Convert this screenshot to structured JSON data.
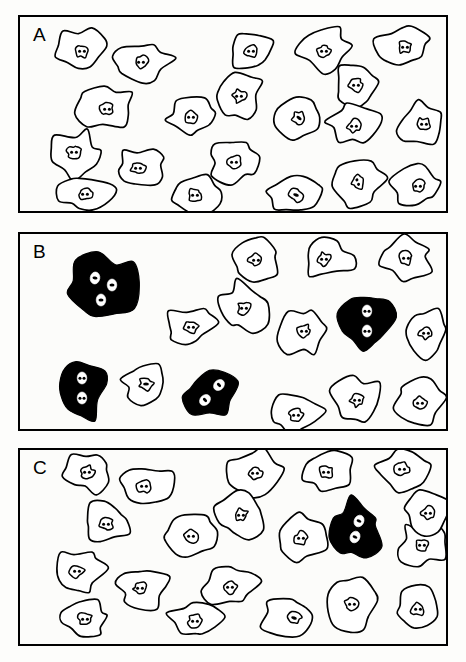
{
  "figure": {
    "type": "scientific-line-drawing",
    "panel_count": 3,
    "background_color": "#fdfdfb",
    "outline_color": "#000000",
    "filled_cell_color": "#000000",
    "unfilled_cell_color": "#ffffff"
  },
  "panels": [
    {
      "id": "A",
      "label": "A",
      "x": 18,
      "y": 15,
      "w": 430,
      "h": 198,
      "total_cells": 20,
      "mononuclear_cells": 20,
      "multinucleated_filled_cells": 0
    },
    {
      "id": "B",
      "label": "B",
      "x": 18,
      "y": 232,
      "w": 430,
      "h": 199,
      "total_cells": 16,
      "mononuclear_cells": 12,
      "multinucleated_filled_cells": 4
    },
    {
      "id": "C",
      "label": "C",
      "x": 18,
      "y": 448,
      "w": 430,
      "h": 198,
      "total_cells": 20,
      "mononuclear_cells": 19,
      "multinucleated_filled_cells": 1
    }
  ],
  "chart_data": {
    "type": "diagram",
    "title": "",
    "panels": [
      "A",
      "B",
      "C"
    ],
    "series": [
      {
        "name": "Mononuclear cells",
        "values": [
          20,
          12,
          19
        ]
      },
      {
        "name": "Multinucleated giant cells (filled black)",
        "values": [
          0,
          4,
          1
        ]
      }
    ],
    "nuclei_per_filled_cell": {
      "A": [],
      "B": [
        3,
        2,
        2,
        2
      ],
      "C": [
        2
      ]
    }
  },
  "cells": {
    "A": [
      {
        "cx": 80,
        "cy": 47,
        "rx": 27,
        "ry": 21,
        "seed": 11,
        "filled": false,
        "nuclei": [
          {
            "dx": 0,
            "dy": 2,
            "r": 7,
            "dots": 2,
            "rot": 0
          }
        ]
      },
      {
        "cx": 141,
        "cy": 59,
        "rx": 29,
        "ry": 19,
        "seed": 22,
        "filled": false,
        "nuclei": [
          {
            "dx": -2,
            "dy": 1,
            "r": 7,
            "dots": 2,
            "rot": 0
          }
        ]
      },
      {
        "cx": 249,
        "cy": 48,
        "rx": 24,
        "ry": 20,
        "seed": 33,
        "filled": false,
        "nuclei": [
          {
            "dx": 0,
            "dy": 1,
            "r": 7,
            "dots": 2,
            "rot": 0
          }
        ]
      },
      {
        "cx": 322,
        "cy": 47,
        "rx": 26,
        "ry": 22,
        "seed": 44,
        "filled": false,
        "nuclei": [
          {
            "dx": 0,
            "dy": 2,
            "r": 7,
            "dots": 2,
            "rot": 0
          }
        ]
      },
      {
        "cx": 401,
        "cy": 45,
        "rx": 27,
        "ry": 21,
        "seed": 55,
        "filled": false,
        "nuclei": [
          {
            "dx": 2,
            "dy": 0,
            "r": 7,
            "dots": 2,
            "rot": 0
          }
        ]
      },
      {
        "cx": 354,
        "cy": 83,
        "rx": 22,
        "ry": 21,
        "seed": 66,
        "filled": false,
        "nuclei": [
          {
            "dx": 0,
            "dy": 0,
            "r": 7,
            "dots": 2,
            "rot": 0
          }
        ]
      },
      {
        "cx": 105,
        "cy": 105,
        "rx": 28,
        "ry": 21,
        "seed": 77,
        "filled": false,
        "nuclei": [
          {
            "dx": 0,
            "dy": 2,
            "r": 7,
            "dots": 2,
            "rot": 0
          }
        ]
      },
      {
        "cx": 189,
        "cy": 114,
        "rx": 25,
        "ry": 18,
        "seed": 88,
        "filled": false,
        "nuclei": [
          {
            "dx": 0,
            "dy": 1,
            "r": 7,
            "dots": 2,
            "rot": 0
          }
        ]
      },
      {
        "cx": 237,
        "cy": 95,
        "rx": 24,
        "ry": 23,
        "seed": 99,
        "filled": false,
        "nuclei": [
          {
            "dx": 0,
            "dy": -1,
            "r": 7,
            "dots": 2,
            "rot": 0
          }
        ]
      },
      {
        "cx": 296,
        "cy": 118,
        "rx": 26,
        "ry": 21,
        "seed": 101,
        "filled": false,
        "nuclei": [
          {
            "dx": 1,
            "dy": -2,
            "r": 7,
            "dots": 1,
            "rot": 35
          }
        ]
      },
      {
        "cx": 352,
        "cy": 123,
        "rx": 26,
        "ry": 20,
        "seed": 112,
        "filled": false,
        "nuclei": [
          {
            "dx": 0,
            "dy": 1,
            "r": 7,
            "dots": 2,
            "rot": 0
          }
        ]
      },
      {
        "cx": 420,
        "cy": 121,
        "rx": 24,
        "ry": 20,
        "seed": 123,
        "filled": false,
        "nuclei": [
          {
            "dx": 2,
            "dy": 1,
            "r": 7,
            "dots": 2,
            "rot": 0
          }
        ]
      },
      {
        "cx": 74,
        "cy": 152,
        "rx": 25,
        "ry": 23,
        "seed": 134,
        "filled": false,
        "nuclei": [
          {
            "dx": -2,
            "dy": -2,
            "r": 7,
            "dots": 2,
            "rot": 0
          }
        ]
      },
      {
        "cx": 139,
        "cy": 165,
        "rx": 27,
        "ry": 19,
        "seed": 145,
        "filled": false,
        "nuclei": [
          {
            "dx": -3,
            "dy": 1,
            "r": 7,
            "dots": 2,
            "rot": 0
          }
        ]
      },
      {
        "cx": 232,
        "cy": 158,
        "rx": 27,
        "ry": 22,
        "seed": 156,
        "filled": false,
        "nuclei": [
          {
            "dx": 0,
            "dy": 2,
            "r": 7,
            "dots": 2,
            "rot": 0
          }
        ]
      },
      {
        "cx": 83,
        "cy": 191,
        "rx": 27,
        "ry": 18,
        "seed": 167,
        "filled": false,
        "nuclei": [
          {
            "dx": 0,
            "dy": 1,
            "r": 7,
            "dots": 2,
            "rot": 0
          }
        ]
      },
      {
        "cx": 194,
        "cy": 192,
        "rx": 28,
        "ry": 18,
        "seed": 178,
        "filled": false,
        "nuclei": [
          {
            "dx": -1,
            "dy": 1,
            "r": 7,
            "dots": 2,
            "rot": 0
          }
        ]
      },
      {
        "cx": 290,
        "cy": 192,
        "rx": 27,
        "ry": 19,
        "seed": 189,
        "filled": false,
        "nuclei": [
          {
            "dx": 4,
            "dy": 1,
            "r": 7,
            "dots": 1,
            "rot": 20
          }
        ]
      },
      {
        "cx": 356,
        "cy": 180,
        "rx": 25,
        "ry": 23,
        "seed": 190,
        "filled": false,
        "nuclei": [
          {
            "dx": 0,
            "dy": 0,
            "r": 7,
            "dots": 2,
            "rot": 70
          }
        ]
      },
      {
        "cx": 416,
        "cy": 183,
        "rx": 25,
        "ry": 22,
        "seed": 201,
        "filled": false,
        "nuclei": [
          {
            "dx": 0,
            "dy": 1,
            "r": 7,
            "dots": 2,
            "rot": 0
          }
        ]
      }
    ],
    "B": [
      {
        "cx": 100,
        "cy": 286,
        "rx": 35,
        "ry": 36,
        "seed": 211,
        "filled": true,
        "nuclei": [
          {
            "dx": -7,
            "dy": -10,
            "r": 6,
            "dots": 1,
            "rot": 10
          },
          {
            "dx": 10,
            "dy": -3,
            "r": 6,
            "dots": 1,
            "rot": 0
          },
          {
            "dx": -1,
            "dy": 12,
            "r": 6,
            "dots": 1,
            "rot": 0
          }
        ]
      },
      {
        "cx": 254,
        "cy": 258,
        "rx": 24,
        "ry": 21,
        "seed": 222,
        "filled": false,
        "nuclei": [
          {
            "dx": 0,
            "dy": 0,
            "r": 7,
            "dots": 2,
            "rot": 0
          }
        ]
      },
      {
        "cx": 325,
        "cy": 257,
        "rx": 27,
        "ry": 20,
        "seed": 233,
        "filled": false,
        "nuclei": [
          {
            "dx": -3,
            "dy": 0,
            "r": 7,
            "dots": 2,
            "rot": 0
          }
        ]
      },
      {
        "cx": 404,
        "cy": 257,
        "rx": 26,
        "ry": 22,
        "seed": 244,
        "filled": false,
        "nuclei": [
          {
            "dx": 0,
            "dy": -1,
            "r": 7,
            "dots": 2,
            "rot": 0
          }
        ]
      },
      {
        "cx": 242,
        "cy": 305,
        "rx": 25,
        "ry": 25,
        "seed": 255,
        "filled": false,
        "nuclei": [
          {
            "dx": 0,
            "dy": 1,
            "r": 7,
            "dots": 2,
            "rot": 0
          }
        ]
      },
      {
        "cx": 187,
        "cy": 324,
        "rx": 25,
        "ry": 19,
        "seed": 266,
        "filled": false,
        "nuclei": [
          {
            "dx": 2,
            "dy": 1,
            "r": 7,
            "dots": 2,
            "rot": 0
          }
        ]
      },
      {
        "cx": 302,
        "cy": 330,
        "rx": 25,
        "ry": 24,
        "seed": 277,
        "filled": false,
        "nuclei": [
          {
            "dx": 0,
            "dy": -1,
            "r": 7,
            "dots": 2,
            "rot": 0
          }
        ]
      },
      {
        "cx": 365,
        "cy": 320,
        "rx": 26,
        "ry": 31,
        "seed": 288,
        "filled": true,
        "nuclei": [
          {
            "dx": 0,
            "dy": -11,
            "r": 6,
            "dots": 2,
            "rot": 0
          },
          {
            "dx": 0,
            "dy": 9,
            "r": 6,
            "dots": 2,
            "rot": 0
          }
        ]
      },
      {
        "cx": 424,
        "cy": 331,
        "rx": 23,
        "ry": 23,
        "seed": 299,
        "filled": false,
        "nuclei": [
          {
            "dx": 0,
            "dy": 0,
            "r": 7,
            "dots": 2,
            "rot": 0
          }
        ]
      },
      {
        "cx": 80,
        "cy": 386,
        "rx": 25,
        "ry": 32,
        "seed": 301,
        "filled": true,
        "nuclei": [
          {
            "dx": 0,
            "dy": -10,
            "r": 6,
            "dots": 2,
            "rot": 0
          },
          {
            "dx": 0,
            "dy": 10,
            "r": 6,
            "dots": 2,
            "rot": 0
          }
        ]
      },
      {
        "cx": 144,
        "cy": 382,
        "rx": 24,
        "ry": 20,
        "seed": 312,
        "filled": false,
        "nuclei": [
          {
            "dx": 0,
            "dy": 0,
            "r": 7,
            "dots": 1,
            "rot": 0
          }
        ]
      },
      {
        "cx": 209,
        "cy": 391,
        "rx": 27,
        "ry": 24,
        "seed": 323,
        "filled": true,
        "nuclei": [
          {
            "dx": 8,
            "dy": -8,
            "r": 6,
            "dots": 1,
            "rot": 45
          },
          {
            "dx": -6,
            "dy": 7,
            "r": 6,
            "dots": 1,
            "rot": 45
          }
        ]
      },
      {
        "cx": 294,
        "cy": 412,
        "rx": 26,
        "ry": 20,
        "seed": 334,
        "filled": false,
        "nuclei": [
          {
            "dx": 0,
            "dy": 1,
            "r": 7,
            "dots": 2,
            "rot": 0
          }
        ]
      },
      {
        "cx": 355,
        "cy": 398,
        "rx": 25,
        "ry": 24,
        "seed": 345,
        "filled": false,
        "nuclei": [
          {
            "dx": 0,
            "dy": 0,
            "r": 7,
            "dots": 2,
            "rot": 0
          }
        ]
      },
      {
        "cx": 418,
        "cy": 399,
        "rx": 24,
        "ry": 22,
        "seed": 356,
        "filled": false,
        "nuclei": [
          {
            "dx": 0,
            "dy": 2,
            "r": 7,
            "dots": 2,
            "rot": 0
          }
        ]
      }
    ],
    "C": [
      {
        "cx": 85,
        "cy": 470,
        "rx": 27,
        "ry": 20,
        "seed": 411,
        "filled": false,
        "nuclei": [
          {
            "dx": 0,
            "dy": 0,
            "r": 7,
            "dots": 2,
            "rot": 0
          }
        ]
      },
      {
        "cx": 145,
        "cy": 483,
        "rx": 29,
        "ry": 20,
        "seed": 422,
        "filled": false,
        "nuclei": [
          {
            "dx": -3,
            "dy": 1,
            "r": 7,
            "dots": 2,
            "rot": 0
          }
        ]
      },
      {
        "cx": 253,
        "cy": 470,
        "rx": 25,
        "ry": 22,
        "seed": 433,
        "filled": false,
        "nuclei": [
          {
            "dx": 0,
            "dy": 1,
            "r": 7,
            "dots": 2,
            "rot": 0
          }
        ]
      },
      {
        "cx": 325,
        "cy": 470,
        "rx": 26,
        "ry": 22,
        "seed": 444,
        "filled": false,
        "nuclei": [
          {
            "dx": -1,
            "dy": 0,
            "r": 7,
            "dots": 2,
            "rot": 0
          }
        ]
      },
      {
        "cx": 400,
        "cy": 467,
        "rx": 26,
        "ry": 21,
        "seed": 455,
        "filled": false,
        "nuclei": [
          {
            "dx": 0,
            "dy": 0,
            "r": 7,
            "dots": 2,
            "rot": 0
          }
        ]
      },
      {
        "cx": 104,
        "cy": 521,
        "rx": 25,
        "ry": 22,
        "seed": 466,
        "filled": false,
        "nuclei": [
          {
            "dx": 0,
            "dy": 1,
            "r": 7,
            "dots": 2,
            "rot": 0
          }
        ]
      },
      {
        "cx": 189,
        "cy": 533,
        "rx": 25,
        "ry": 20,
        "seed": 477,
        "filled": false,
        "nuclei": [
          {
            "dx": 0,
            "dy": 1,
            "r": 7,
            "dots": 2,
            "rot": 0
          }
        ]
      },
      {
        "cx": 239,
        "cy": 513,
        "rx": 25,
        "ry": 23,
        "seed": 488,
        "filled": false,
        "nuclei": [
          {
            "dx": 0,
            "dy": 0,
            "r": 7,
            "dots": 2,
            "rot": 0
          }
        ]
      },
      {
        "cx": 298,
        "cy": 536,
        "rx": 26,
        "ry": 23,
        "seed": 499,
        "filled": false,
        "nuclei": [
          {
            "dx": 1,
            "dy": 0,
            "r": 7,
            "dots": 2,
            "rot": 0
          }
        ]
      },
      {
        "cx": 355,
        "cy": 527,
        "rx": 25,
        "ry": 30,
        "seed": 510,
        "filled": true,
        "nuclei": [
          {
            "dx": 2,
            "dy": -8,
            "r": 6,
            "dots": 1,
            "rot": 25
          },
          {
            "dx": -2,
            "dy": 8,
            "r": 6,
            "dots": 1,
            "rot": 25
          }
        ]
      },
      {
        "cx": 420,
        "cy": 543,
        "rx": 24,
        "ry": 21,
        "seed": 521,
        "filled": false,
        "nuclei": [
          {
            "dx": 0,
            "dy": 0,
            "r": 7,
            "dots": 2,
            "rot": 0
          }
        ]
      },
      {
        "cx": 77,
        "cy": 570,
        "rx": 25,
        "ry": 24,
        "seed": 532,
        "filled": false,
        "nuclei": [
          {
            "dx": -2,
            "dy": -1,
            "r": 7,
            "dots": 2,
            "rot": 0
          }
        ]
      },
      {
        "cx": 141,
        "cy": 586,
        "rx": 26,
        "ry": 21,
        "seed": 543,
        "filled": false,
        "nuclei": [
          {
            "dx": -3,
            "dy": 0,
            "r": 7,
            "dots": 2,
            "rot": 0
          }
        ]
      },
      {
        "cx": 228,
        "cy": 583,
        "rx": 28,
        "ry": 22,
        "seed": 554,
        "filled": false,
        "nuclei": [
          {
            "dx": 0,
            "dy": 2,
            "r": 7,
            "dots": 2,
            "rot": 0
          }
        ]
      },
      {
        "cx": 83,
        "cy": 616,
        "rx": 26,
        "ry": 19,
        "seed": 565,
        "filled": false,
        "nuclei": [
          {
            "dx": 0,
            "dy": 1,
            "r": 7,
            "dots": 2,
            "rot": 0
          }
        ]
      },
      {
        "cx": 194,
        "cy": 618,
        "rx": 27,
        "ry": 19,
        "seed": 576,
        "filled": false,
        "nuclei": [
          {
            "dx": -1,
            "dy": 1,
            "r": 7,
            "dots": 2,
            "rot": 0
          }
        ]
      },
      {
        "cx": 288,
        "cy": 616,
        "rx": 28,
        "ry": 20,
        "seed": 587,
        "filled": false,
        "nuclei": [
          {
            "dx": 4,
            "dy": 0,
            "r": 7,
            "dots": 1,
            "rot": 20
          }
        ]
      },
      {
        "cx": 350,
        "cy": 602,
        "rx": 25,
        "ry": 24,
        "seed": 598,
        "filled": false,
        "nuclei": [
          {
            "dx": 0,
            "dy": 0,
            "r": 7,
            "dots": 2,
            "rot": 0
          }
        ]
      },
      {
        "cx": 416,
        "cy": 606,
        "rx": 25,
        "ry": 22,
        "seed": 609,
        "filled": false,
        "nuclei": [
          {
            "dx": 0,
            "dy": 1,
            "r": 7,
            "dots": 2,
            "rot": 0
          }
        ]
      },
      {
        "cx": 424,
        "cy": 510,
        "rx": 24,
        "ry": 21,
        "seed": 620,
        "filled": false,
        "nuclei": [
          {
            "dx": 2,
            "dy": 1,
            "r": 7,
            "dots": 2,
            "rot": 0
          }
        ]
      }
    ]
  }
}
